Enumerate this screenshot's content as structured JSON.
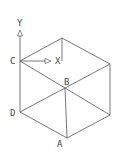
{
  "diagram": {
    "type": "isometric-cube",
    "vertices": {
      "top": [
        62,
        38
      ],
      "C": [
        20,
        61
      ],
      "right_top": [
        110,
        64
      ],
      "B": [
        65,
        88
      ],
      "D": [
        20,
        112
      ],
      "right_bottom": [
        110,
        115
      ],
      "A": [
        67,
        138
      ]
    },
    "labels": {
      "C": "C",
      "B": "B",
      "D": "D",
      "A": "A",
      "x_axis": "X",
      "y_axis": "Y"
    },
    "line_color": "#555555"
  }
}
